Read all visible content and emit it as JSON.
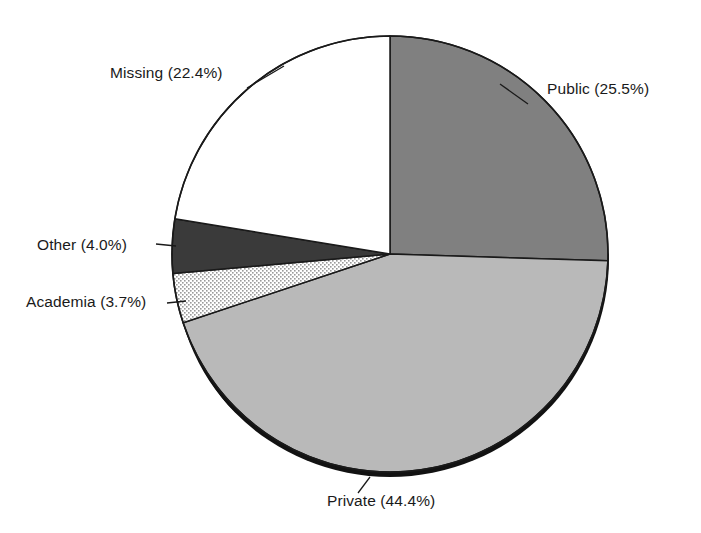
{
  "chart_data": {
    "type": "pie",
    "title": "",
    "subtitle": "",
    "xlabel": "",
    "ylabel": "",
    "legend_position": "none",
    "labels_position": "outside",
    "grid": false,
    "start_angle_deg": 0,
    "direction": "clockwise",
    "categories": [
      "Public",
      "Private",
      "Academia",
      "Other",
      "Missing"
    ],
    "values": [
      25.5,
      44.4,
      3.7,
      4.0,
      22.4
    ],
    "value_unit": "percent",
    "slices": [
      {
        "name": "Public",
        "label": "Public (25.5%)",
        "value": 25.5,
        "percent_text": "25.5%",
        "fill": "#808080",
        "pattern": "solid",
        "start_deg": 0.0,
        "end_deg": 91.8
      },
      {
        "name": "Private",
        "label": "Private (44.4%)",
        "value": 44.4,
        "percent_text": "44.4%",
        "fill": "#b9b9b9",
        "pattern": "solid",
        "start_deg": 91.8,
        "end_deg": 251.6
      },
      {
        "name": "Academia",
        "label": "Academia (3.7%)",
        "value": 3.7,
        "percent_text": "3.7%",
        "fill": "#ffffff",
        "pattern": "stipple-dots",
        "start_deg": 251.6,
        "end_deg": 264.9
      },
      {
        "name": "Other",
        "label": "Other (4.0%)",
        "value": 4.0,
        "percent_text": "4.0%",
        "fill": "#3a3a3a",
        "pattern": "solid",
        "start_deg": 264.9,
        "end_deg": 279.3
      },
      {
        "name": "Missing",
        "label": "Missing (22.4%)",
        "value": 22.4,
        "percent_text": "22.4%",
        "fill": "#ffffff",
        "pattern": "solid",
        "start_deg": 279.3,
        "end_deg": 360.0
      }
    ],
    "total_percent": 100.0,
    "geometry": {
      "center_x": 390,
      "center_y": 254,
      "radius": 218
    },
    "colors": {
      "outline": "#1a1a1a",
      "background": "#ffffff",
      "shadow": "#111111",
      "text": "#1a1a1a"
    }
  }
}
